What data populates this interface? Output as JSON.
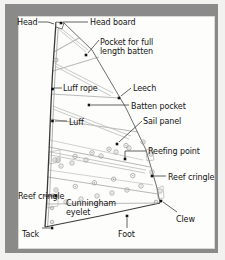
{
  "figure": {
    "frame_color": "#8a8a8a",
    "background_color": "#fdfdfc",
    "outline_color": "#3a3a3a",
    "seam_color": "#b9b9b9",
    "leader_color": "#3a3a3a",
    "eyelet_color": "#a0a0a0",
    "marker_color": "#111111"
  },
  "labels": [
    {
      "id": "head",
      "text": "Head",
      "x": 17,
      "y": 18,
      "align": "left",
      "wrap": false
    },
    {
      "id": "head-board",
      "text": "Head board",
      "x": 90,
      "y": 18,
      "align": "left",
      "wrap": false
    },
    {
      "id": "pocket-full-batten",
      "text": "Pocket for full length batten",
      "x": 100,
      "y": 38,
      "align": "left",
      "wrap": true
    },
    {
      "id": "luff-rope",
      "text": "Luff rope",
      "x": 63,
      "y": 84,
      "align": "left",
      "wrap": false
    },
    {
      "id": "leech",
      "text": "Leech",
      "x": 133,
      "y": 84,
      "align": "left",
      "wrap": false
    },
    {
      "id": "batten-pocket",
      "text": "Batten pocket",
      "x": 131,
      "y": 102,
      "align": "left",
      "wrap": false
    },
    {
      "id": "luff",
      "text": "Luff",
      "x": 69,
      "y": 118,
      "align": "left",
      "wrap": false
    },
    {
      "id": "sail-panel",
      "text": "Sail panel",
      "x": 143,
      "y": 117,
      "align": "left",
      "wrap": false
    },
    {
      "id": "reefing-point",
      "text": "Reefing point",
      "x": 148,
      "y": 147,
      "align": "left",
      "wrap": false
    },
    {
      "id": "reef-cringle-right",
      "text": "Reef cringle",
      "x": 168,
      "y": 173,
      "align": "left",
      "wrap": true
    },
    {
      "id": "reef-cringle-left",
      "text": "Reef cringle",
      "x": 18,
      "y": 192,
      "align": "left",
      "wrap": true
    },
    {
      "id": "cunningham-eyelet",
      "text": "Cunningham eyelet",
      "x": 66,
      "y": 199,
      "align": "left",
      "wrap": true
    },
    {
      "id": "clew",
      "text": "Clew",
      "x": 176,
      "y": 215,
      "align": "left",
      "wrap": false
    },
    {
      "id": "tack",
      "text": "Tack",
      "x": 22,
      "y": 230,
      "align": "left",
      "wrap": false
    },
    {
      "id": "foot",
      "text": "Foot",
      "x": 118,
      "y": 230,
      "align": "left",
      "wrap": false
    }
  ],
  "diagram": {
    "sail_outline": "M 56,22 L 52.5,74 L 51,104 L 49,152 L 47,196 L 45,227 L 160,203 L 157,188 L 146,150 L 126,108 L 92,50 L 64,23 Z",
    "luff_edge": "M 56,22 L 52.5,74 L 51,104 L 49,152 L 47,196 L 45,227",
    "leech_edge": "M 64,23 L 92,50 L 126,108 L 146,150 L 157,188 L 160,203",
    "foot_edge": "M 45,227 L 100,216 L 160,203",
    "head_board": "M 56,22 L 64,23 L 62,29 L 56,27 Z",
    "seams": [
      "M 53.8,52 L 79,38",
      "M 52.6,71 L 99,57",
      "M 51.4,94 L 120,98",
      "M 50.2,119 L 138,132",
      "M 48.8,147 L 150,167",
      "M 47.4,177 L 158,194",
      "M 46.2,204 L 160,203"
    ],
    "batten_pockets": [
      "M 58,26 L 88,50",
      "M 58.4,29 L 86,52",
      "M 54.4,63 L 113,93",
      "M 54.8,66 L 111,96",
      "M 52.6,106 L 131,136",
      "M 52.9,109 L 129,139",
      "M 50.2,152 L 146,170",
      "M 50.4,155 L 145,173"
    ],
    "reef_bands": [
      "M 49.6,140 L 143,160",
      "M 48.2,170 L 153,185"
    ],
    "reef_patches": [
      "M 49,152 L 60,150 L 60,162 L 49,164 Z",
      "M 47,196 L 58,194 L 58,206 L 47,208 Z",
      "M 146,150 L 152,148 L 154,160 L 147,161 Z",
      "M 157,188 L 163,186 L 164,198 L 158,199 Z"
    ],
    "reef_rows": [
      {
        "y_left": 160,
        "y_right": 142,
        "count": 6,
        "x_start": 58,
        "x_end": 143
      },
      {
        "y_left": 190,
        "y_right": 172,
        "count": 6,
        "x_start": 56,
        "x_end": 152
      }
    ],
    "eyelets": [
      {
        "x": 56,
        "y": 60,
        "r": 2.0
      },
      {
        "x": 55,
        "y": 160,
        "r": 2.2
      },
      {
        "x": 53,
        "y": 196,
        "r": 2.2
      },
      {
        "x": 52,
        "y": 208,
        "r": 1.8
      },
      {
        "x": 52,
        "y": 222,
        "r": 1.8
      },
      {
        "x": 151,
        "y": 154,
        "r": 2.2
      },
      {
        "x": 160,
        "y": 191,
        "r": 2.2
      },
      {
        "x": 156,
        "y": 202,
        "r": 1.8
      },
      {
        "x": 129,
        "y": 148,
        "r": 2.2
      },
      {
        "x": 116,
        "y": 152,
        "r": 2.2
      },
      {
        "x": 101,
        "y": 156,
        "r": 2.2
      },
      {
        "x": 86,
        "y": 160,
        "r": 2.2
      },
      {
        "x": 72,
        "y": 163,
        "r": 2.2
      },
      {
        "x": 61,
        "y": 166,
        "r": 2.2
      },
      {
        "x": 141,
        "y": 186,
        "r": 2.2
      },
      {
        "x": 127,
        "y": 190,
        "r": 2.2
      },
      {
        "x": 112,
        "y": 193,
        "r": 2.2
      },
      {
        "x": 97,
        "y": 196,
        "r": 2.2
      },
      {
        "x": 81,
        "y": 199,
        "r": 2.2
      },
      {
        "x": 66,
        "y": 202,
        "r": 2.2
      }
    ],
    "leaders": [
      {
        "id": "head",
        "path": "M 38,22 L 48,22 L 54,24",
        "dot": null
      },
      {
        "id": "head-board",
        "path": "M 88,22 L 63,22",
        "dot": {
          "x": 61,
          "y": 23
        }
      },
      {
        "id": "pocket-full-batten",
        "path": "M 99,40 L 88,53",
        "dot": {
          "x": 86,
          "y": 55
        }
      },
      {
        "id": "luff-rope",
        "path": "M 62,88 L 54,88",
        "dot": {
          "x": 52.6,
          "y": 89
        }
      },
      {
        "id": "leech",
        "path": "M 131,88 L 121,96",
        "dot": {
          "x": 119,
          "y": 98
        }
      },
      {
        "id": "batten-pocket",
        "path": "M 129,105 L 91,105",
        "dot": {
          "x": 89,
          "y": 105
        }
      },
      {
        "id": "luff",
        "path": "M 67,121 L 55,121",
        "dot": {
          "x": 52.5,
          "y": 121
        }
      },
      {
        "id": "sail-panel",
        "path": "M 142,121 L 119,142",
        "dot": {
          "x": 117,
          "y": 144
        }
      },
      {
        "id": "reefing-point",
        "path": "M 146,151 L 125,151 L 125,158",
        "dot": {
          "x": 125,
          "y": 159
        }
      },
      {
        "id": "reef-cringle-right",
        "path": "M 166,176 L 154,176",
        "dot": {
          "x": 152,
          "y": 176
        }
      },
      {
        "id": "reef-cringle-left",
        "path": "M 44,196 L 55,196",
        "dot": {
          "x": 56,
          "y": 196
        }
      },
      {
        "id": "clew",
        "path": "M 177,212 L 163,202",
        "dot": {
          "x": 161,
          "y": 201
        }
      },
      {
        "id": "tack",
        "path": "M 42,228 L 50,228",
        "dot": {
          "x": 52,
          "y": 228
        }
      },
      {
        "id": "foot",
        "path": "M 127,228 L 127,218",
        "dot": {
          "x": 127,
          "y": 216
        }
      }
    ]
  }
}
